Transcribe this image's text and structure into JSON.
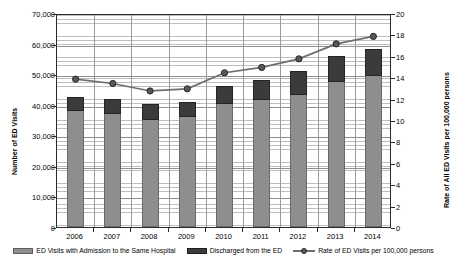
{
  "chart_data": {
    "type": "bar",
    "title": "",
    "subtitle": "",
    "xlabel": "",
    "ylabel": "Number of ED Visits",
    "y2label": "Rate of All ED Visits per 100,000 persons",
    "grid": true,
    "legend_position": "bottom",
    "categories": [
      "2006",
      "2007",
      "2008",
      "2009",
      "2010",
      "2011",
      "2012",
      "2013",
      "2014"
    ],
    "ylim": [
      0,
      70000
    ],
    "y2lim": [
      0,
      20
    ],
    "yticks": [
      "0",
      "10,000",
      "20,000",
      "30,000",
      "40,000",
      "50,000",
      "60,000",
      "70,000"
    ],
    "ytick_values": [
      0,
      10000,
      20000,
      30000,
      40000,
      50000,
      60000,
      70000
    ],
    "y2ticks": [
      "0",
      "2",
      "4",
      "6",
      "8",
      "10",
      "12",
      "14",
      "16",
      "18",
      "20"
    ],
    "y2tick_values": [
      0,
      2,
      4,
      6,
      8,
      10,
      12,
      14,
      16,
      18,
      20
    ],
    "series": [
      {
        "name": "ED Visits with Admission to the Same Hospital",
        "kind": "bar-segment",
        "axis": "left",
        "color": "#8e8e8e",
        "values": [
          37800,
          36900,
          35000,
          35900,
          40100,
          41400,
          43100,
          47500,
          49500
        ]
      },
      {
        "name": "Discharged from the ED",
        "kind": "bar-segment",
        "axis": "left",
        "color": "#3b3b3b",
        "values": [
          4700,
          4900,
          5100,
          5100,
          6100,
          6600,
          7800,
          8300,
          8700
        ]
      },
      {
        "name": "Rate of ED Visits per 100,000 persons",
        "kind": "line",
        "axis": "right",
        "color": "#6e6e6e",
        "values": [
          14.0,
          13.6,
          12.9,
          13.1,
          14.6,
          15.1,
          15.9,
          17.3,
          18.0
        ]
      }
    ],
    "bar_totals": [
      42500,
      41800,
      40100,
      41000,
      46200,
      48000,
      50900,
      55800,
      58200
    ]
  },
  "legend": {
    "items": [
      {
        "label": "ED Visits with Admission to the Same Hospital"
      },
      {
        "label": "Discharged from the ED"
      },
      {
        "label": "Rate of ED Visits per 100,000 persons"
      }
    ]
  },
  "colors": {
    "admitted": "#8e8e8e",
    "discharged": "#3b3b3b",
    "line": "#6e6e6e",
    "marker": "#585858",
    "axis": "#2b2b2b",
    "grid": "#bdbdbd"
  }
}
